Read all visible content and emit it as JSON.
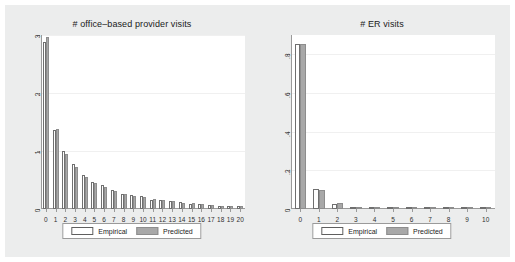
{
  "figure": {
    "background_color": "#eceded",
    "plot_background_color": "#ffffff",
    "empirical_color": "#ffffff",
    "predicted_color": "#a8a8a8",
    "axis_color": "#9a9a9a"
  },
  "legend": {
    "empirical_label": "Empirical",
    "predicted_label": "Predicted"
  },
  "chart_data": [
    {
      "type": "bar",
      "panel": "left",
      "title": "# office–based provider visits",
      "xlabel": "",
      "ylabel": "",
      "xlim": [
        -0.6,
        20.6
      ],
      "ylim": [
        0,
        3
      ],
      "grid": true,
      "legend_position": "bottom",
      "categories": [
        "0",
        "1",
        "2",
        "3",
        "4",
        "5",
        "6",
        "7",
        "8",
        "9",
        "10",
        "11",
        "12",
        "13",
        "14",
        "15",
        "16",
        "17",
        "18",
        "19",
        "20"
      ],
      "ytick_labels": [
        "0",
        "1",
        "2",
        "3"
      ],
      "ytick_values": [
        0,
        1,
        2,
        3
      ],
      "series": [
        {
          "name": "Empirical",
          "values": [
            2.88,
            1.37,
            1.0,
            0.78,
            0.59,
            0.46,
            0.41,
            0.32,
            0.26,
            0.24,
            0.22,
            0.16,
            0.15,
            0.14,
            0.12,
            0.09,
            0.08,
            0.07,
            0.06,
            0.05,
            0.05
          ]
        },
        {
          "name": "Predicted",
          "values": [
            2.97,
            1.38,
            0.95,
            0.73,
            0.56,
            0.45,
            0.38,
            0.31,
            0.26,
            0.23,
            0.2,
            0.17,
            0.15,
            0.13,
            0.11,
            0.1,
            0.08,
            0.07,
            0.06,
            0.06,
            0.05
          ]
        }
      ]
    },
    {
      "type": "bar",
      "panel": "right",
      "title": "# ER visits",
      "xlabel": "",
      "ylabel": "",
      "xlim": [
        -0.6,
        10.6
      ],
      "ylim": [
        0,
        0.9
      ],
      "grid": true,
      "legend_position": "bottom",
      "categories": [
        "0",
        "1",
        "2",
        "3",
        "4",
        "5",
        "6",
        "7",
        "8",
        "9",
        "10"
      ],
      "ytick_labels": [
        "0",
        ".2",
        ".4",
        ".6",
        ".8"
      ],
      "ytick_values": [
        0,
        0.2,
        0.4,
        0.6,
        0.8
      ],
      "series": [
        {
          "name": "Empirical",
          "values": [
            0.855,
            0.105,
            0.027,
            0.008,
            0.003,
            0.002,
            0.001,
            0.001,
            0.001,
            0.0,
            0.0
          ]
        },
        {
          "name": "Predicted",
          "values": [
            0.855,
            0.098,
            0.03,
            0.009,
            0.003,
            0.002,
            0.001,
            0.001,
            0.001,
            0.0,
            0.0
          ]
        }
      ]
    }
  ]
}
